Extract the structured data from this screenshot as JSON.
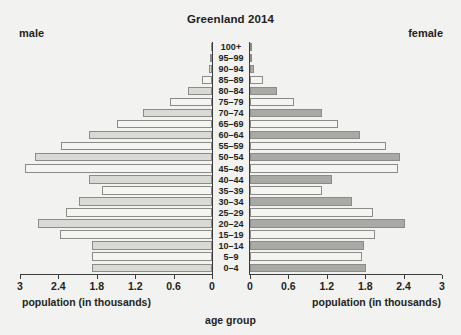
{
  "header": {
    "title": "Greenland 2014",
    "left_label": "male",
    "right_label": "female"
  },
  "axes": {
    "left_title": "population (in thousands)",
    "right_title": "population (in thousands)",
    "category_axis_title": "age group",
    "left_ticks": [
      "3",
      "2.4",
      "1.8",
      "1.2",
      "0.6",
      "0"
    ],
    "right_ticks": [
      "0",
      "0.6",
      "1.2",
      "1.8",
      "2.4",
      "3"
    ]
  },
  "colors": {
    "background": "#f2f2f0",
    "text": "#231f20",
    "axis": "#3b3b39",
    "bar_outline": "#8b8b88",
    "male_light": "#f4f4f2",
    "male_dark": "#d9d9d6",
    "female_light": "#f4f4f2",
    "female_dark": "#a9a9a6"
  },
  "chart_data": {
    "type": "bar",
    "subtype": "population-pyramid",
    "title": "Greenland 2014",
    "xlabel": "population (in thousands)",
    "ylabel": "age group",
    "xlim": [
      0,
      3
    ],
    "grid": false,
    "legend_position": "corners",
    "categories": [
      "100+",
      "95–99",
      "90–94",
      "85–89",
      "80–84",
      "75–79",
      "70–74",
      "65–69",
      "60–64",
      "55–59",
      "50–54",
      "45–49",
      "40–44",
      "35–39",
      "30–34",
      "25–29",
      "20–24",
      "15–19",
      "10–14",
      "5–9",
      "0–4"
    ],
    "series": [
      {
        "name": "male",
        "side": "left",
        "values": [
          0.01,
          0.03,
          0.05,
          0.16,
          0.38,
          0.65,
          1.08,
          1.48,
          1.92,
          2.36,
          2.76,
          2.92,
          1.92,
          1.72,
          2.08,
          2.28,
          2.72,
          2.38,
          1.88,
          1.88,
          1.88
        ]
      },
      {
        "name": "female",
        "side": "right",
        "values": [
          0.01,
          0.03,
          0.07,
          0.2,
          0.42,
          0.68,
          1.12,
          1.38,
          1.72,
          2.12,
          2.34,
          2.32,
          1.28,
          1.12,
          1.6,
          1.92,
          2.42,
          1.96,
          1.78,
          1.75,
          1.82
        ]
      }
    ]
  }
}
